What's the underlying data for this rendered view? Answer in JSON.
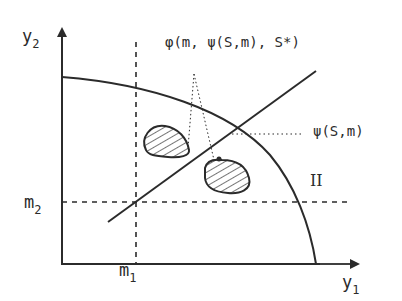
{
  "diagram": {
    "axes": {
      "x_label": "y",
      "x_label_sub": "1",
      "y_label": "y",
      "y_label_sub": "2"
    },
    "guides": {
      "vertical_label": "m",
      "vertical_label_sub": "1",
      "horizontal_label": "m",
      "horizontal_label_sub": "2"
    },
    "annotations": {
      "top": "φ(m, ψ(S,m), S*)",
      "right": "ψ(S,m)",
      "region": "II"
    },
    "elements": [
      "frontier-curve",
      "rising-line",
      "hatched-region-upper-left",
      "hatched-region-lower-right",
      "dotted-leader-triangle",
      "dotted-leader-right"
    ],
    "colors": {
      "ink": "#2b2b2b",
      "background": "#ffffff"
    }
  }
}
